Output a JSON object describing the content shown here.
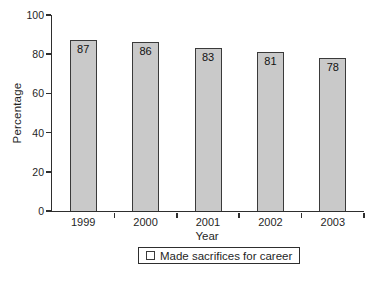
{
  "chart_data": {
    "type": "bar",
    "categories": [
      "1999",
      "2000",
      "2001",
      "2002",
      "2003"
    ],
    "values": [
      87,
      86,
      83,
      81,
      78
    ],
    "series_name": "Made sacrifices for career",
    "title": "",
    "xlabel": "Year",
    "ylabel": "Percentage",
    "ylim": [
      0,
      100
    ],
    "yticks": [
      0,
      20,
      40,
      60,
      80,
      100
    ],
    "grid": false,
    "value_labels_shown": true,
    "value_label_position": "inside-top",
    "legend": {
      "label": "Made sacrifices for career",
      "position": "bottom-center"
    },
    "colors": {
      "bar_fill": "#c9c9c9",
      "bar_border": "#3a3a3a",
      "axis": "#2e2e2e",
      "text": "#1f1f1f",
      "background": "#ffffff"
    }
  }
}
